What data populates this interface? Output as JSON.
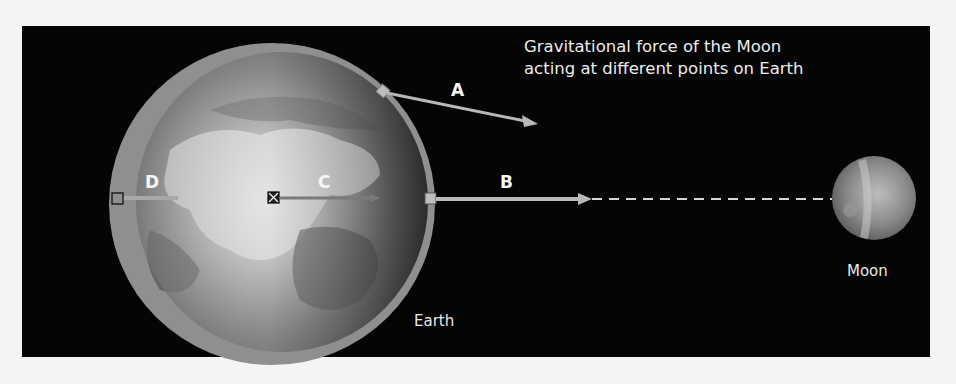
{
  "title": {
    "line1": "Gravitational force of the Moon",
    "line2": "acting at different points on Earth"
  },
  "labels": {
    "earth": "Earth",
    "moon": "Moon"
  },
  "vectors": [
    {
      "id": "A",
      "label": "A",
      "description": "force at upper surface point, angled toward Moon"
    },
    {
      "id": "B",
      "label": "B",
      "description": "force at near-side surface point, longest"
    },
    {
      "id": "C",
      "label": "C",
      "description": "force at Earth's center"
    },
    {
      "id": "D",
      "label": "D",
      "description": "force at far-side surface point, shortest"
    }
  ],
  "colors": {
    "background": "#050505",
    "page": "#f4f4f4",
    "arrow": "#b4b4b4",
    "earth_rim": "#8c8c8c",
    "text": "#ececec"
  }
}
